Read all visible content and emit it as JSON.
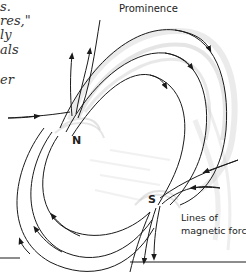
{
  "text_fragments": [
    "s.",
    "res,\"",
    "ly",
    "als",
    "",
    "er"
  ],
  "labels": {
    "prominence": "Prominence",
    "north_pole": "N",
    "south_pole": "S",
    "lines_of_force_line1": "Lines of",
    "lines_of_force_line2": "magnetic force"
  },
  "colors": {
    "background": "#ffffff",
    "field_line": "#1a1a1a",
    "plasma_shading": "#9a9a9a",
    "text": "#222222"
  }
}
